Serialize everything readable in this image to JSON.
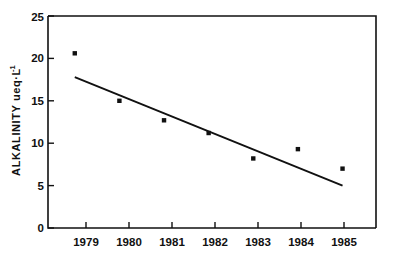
{
  "chart_data": {
    "type": "scatter",
    "title": "",
    "xlabel": "",
    "ylabel": "ALKALINITY ueq·L",
    "ylabel_superscript": "-1",
    "categories": [
      "1979",
      "1980",
      "1981",
      "1982",
      "1983",
      "1984",
      "1985"
    ],
    "x": [
      1979,
      1980,
      1981,
      1982,
      1983,
      1984,
      1985
    ],
    "values": [
      20.6,
      15.0,
      12.7,
      11.2,
      8.2,
      9.3,
      7.0
    ],
    "series": [
      {
        "name": "Alkalinity",
        "values": [
          20.6,
          15.0,
          12.7,
          11.2,
          8.2,
          9.3,
          7.0
        ]
      },
      {
        "name": "Linear trend",
        "type": "line",
        "x": [
          1979,
          1985
        ],
        "values": [
          17.8,
          5.0
        ]
      }
    ],
    "xlim": [
      1978.4,
      1985.75
    ],
    "ylim": [
      0,
      25
    ],
    "yticks": [
      0,
      5,
      10,
      15,
      20,
      25
    ],
    "ytick_labels": [
      "0",
      "5",
      "10",
      "15",
      "20",
      "25"
    ],
    "xtick_labels": [
      "1979",
      "1980",
      "1981",
      "1982",
      "1983",
      "1984",
      "1985"
    ],
    "grid": false,
    "legend": "none",
    "marker": "square",
    "colors": {
      "axis": "#111111",
      "marker": "#111111",
      "trend": "#111111",
      "background": "#ffffff"
    }
  }
}
